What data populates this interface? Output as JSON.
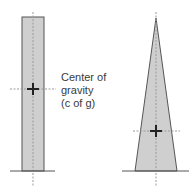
{
  "diagram": {
    "label": {
      "lines": [
        "Center of",
        "gravity",
        "(c of g)"
      ]
    },
    "shapes": [
      {
        "name": "rectangle",
        "fill": "#cfcfcf",
        "stroke": "#555555"
      },
      {
        "name": "tapered-triangle",
        "fill": "#cfcfcf",
        "stroke": "#555555"
      }
    ],
    "colors": {
      "shape_fill": "#cfcfcf",
      "shape_stroke": "#555555",
      "dashed_line": "#9a9a9a",
      "cross": "#222222",
      "ground": "#555555"
    }
  }
}
